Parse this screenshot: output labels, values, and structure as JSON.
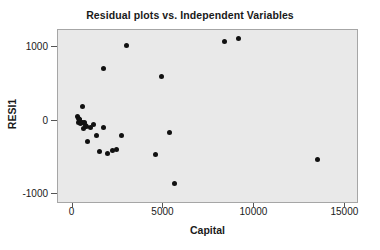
{
  "chart_data": {
    "type": "scatter",
    "title": "Residual plots vs. Independent Variables",
    "xlabel": "Capital",
    "ylabel": "RESI1",
    "xlim": [
      -800,
      15750
    ],
    "ylim": [
      -1130,
      1230
    ],
    "xticks": [
      0,
      5000,
      10000,
      15000
    ],
    "xtick_labels": [
      "0",
      "5000",
      "10000",
      "15000"
    ],
    "yticks": [
      1000,
      0,
      -1000
    ],
    "ytick_labels": [
      "1000",
      "0",
      "-1000"
    ],
    "grid": false,
    "legend": null,
    "marker": "filled-circle",
    "marker_color": "#111111",
    "plot_background": "#e9e9e9",
    "frame_color": "#a6a6a6",
    "points": [
      {
        "x": 250,
        "y": 60
      },
      {
        "x": 300,
        "y": 30
      },
      {
        "x": 330,
        "y": -20
      },
      {
        "x": 360,
        "y": 20
      },
      {
        "x": 400,
        "y": 10
      },
      {
        "x": 430,
        "y": -40
      },
      {
        "x": 520,
        "y": 195
      },
      {
        "x": 560,
        "y": -30
      },
      {
        "x": 600,
        "y": -100
      },
      {
        "x": 650,
        "y": -25
      },
      {
        "x": 700,
        "y": -60
      },
      {
        "x": 760,
        "y": -75
      },
      {
        "x": 820,
        "y": -285
      },
      {
        "x": 1000,
        "y": -90
      },
      {
        "x": 1150,
        "y": -55
      },
      {
        "x": 1300,
        "y": -200
      },
      {
        "x": 1480,
        "y": -415
      },
      {
        "x": 1700,
        "y": 710
      },
      {
        "x": 1720,
        "y": -95
      },
      {
        "x": 1900,
        "y": -450
      },
      {
        "x": 2200,
        "y": -410
      },
      {
        "x": 2400,
        "y": -390
      },
      {
        "x": 2700,
        "y": -195
      },
      {
        "x": 2950,
        "y": 1020
      },
      {
        "x": 4550,
        "y": -465
      },
      {
        "x": 4900,
        "y": 600
      },
      {
        "x": 5350,
        "y": -160
      },
      {
        "x": 5600,
        "y": -855
      },
      {
        "x": 8350,
        "y": 1075
      },
      {
        "x": 9150,
        "y": 1110
      },
      {
        "x": 13450,
        "y": -525
      }
    ]
  }
}
